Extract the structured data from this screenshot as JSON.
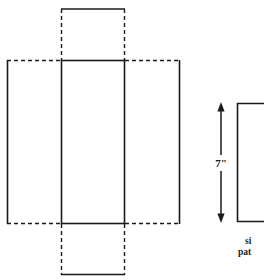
{
  "figure": {
    "background_color": "#ffffff",
    "stroke_color": "#1a1a1a",
    "net": {
      "name": "box-net",
      "description": "Cross-shaped net of a rectangular box",
      "center_panel": {
        "label": "center-panel",
        "x": 61,
        "y": 60,
        "width": 64,
        "height": 164,
        "edge_style": "solid"
      },
      "left_panel": {
        "label": "left-panel",
        "x": 7,
        "y": 60,
        "width": 54,
        "height": 164,
        "solid_edges": [
          "left"
        ],
        "dashed_edges": [
          "top",
          "bottom"
        ]
      },
      "right_panel": {
        "label": "right-panel",
        "x": 125,
        "y": 60,
        "width": 55,
        "height": 164,
        "solid_edges": [
          "right"
        ],
        "dashed_edges": [
          "top",
          "bottom"
        ]
      },
      "top_flap": {
        "label": "top-flap",
        "x": 61,
        "y": 9,
        "width": 64,
        "height": 51,
        "solid_edges": [
          "top"
        ],
        "dashed_edges": [
          "left",
          "right"
        ]
      },
      "bottom_flap": {
        "label": "bottom-flap",
        "x": 61,
        "y": 224,
        "width": 64,
        "height": 51,
        "solid_edges": [
          "bottom"
        ],
        "dashed_edges": [
          "left",
          "right"
        ]
      }
    },
    "side_pattern": {
      "name": "side-pattern",
      "rectangle": {
        "label": "side-pattern-rectangle",
        "x": 237,
        "y": 103,
        "width": 27,
        "height": 119,
        "edge_style": "solid",
        "clipped_right": true
      },
      "dimension": {
        "label": "height-dimension",
        "value": "7\"",
        "orientation": "vertical",
        "arrow_x": 221,
        "arrow_top_y": 103,
        "arrow_bottom_y": 222,
        "arrow_heads": "both"
      },
      "caption": {
        "label": "side-pattern-caption",
        "line1": "si",
        "line2": "pat",
        "full_text_clipped": true
      }
    }
  }
}
